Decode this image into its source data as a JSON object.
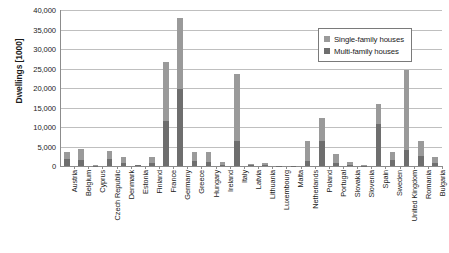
{
  "chart_data": {
    "type": "bar",
    "title": "",
    "subtitle": "",
    "xlabel": "",
    "ylabel": "Dwellings [1000]",
    "ylim": [
      0,
      40000
    ],
    "ytick_labels": [
      "0",
      "5,000",
      "10,000",
      "15,000",
      "20,000",
      "25,000",
      "30,000",
      "35,000",
      "40,000"
    ],
    "ytick_values": [
      0,
      5000,
      10000,
      15000,
      20000,
      25000,
      30000,
      35000,
      40000
    ],
    "grid": true,
    "stacked": true,
    "legend_position": "top-right",
    "categories": [
      "Austria",
      "Belgium",
      "Cyprus",
      "Czech Republic",
      "Denmark",
      "Estonia",
      "Finland",
      "France",
      "Germany",
      "Greece",
      "Hungary",
      "Ireland",
      "Italy",
      "Latvia",
      "Lithuania",
      "Luxembourg",
      "Malta",
      "Netherlands",
      "Poland",
      "Portugal",
      "Slovakia",
      "Slovenia",
      "Spain",
      "Sweden",
      "United Kingdom",
      "Romania",
      "Bulgaria"
    ],
    "series": [
      {
        "name": "Single-family houses",
        "color": "#9a9a9a",
        "values": [
          1900,
          2800,
          100,
          2200,
          1500,
          150,
          1600,
          15200,
          18100,
          2200,
          2600,
          800,
          17200,
          300,
          500,
          60,
          50,
          5100,
          6100,
          2400,
          700,
          120,
          5200,
          2000,
          20500,
          4000,
          1500
        ]
      },
      {
        "name": "Multi-family houses",
        "color": "#6e6e6e",
        "values": [
          1700,
          1600,
          80,
          1700,
          900,
          150,
          700,
          11500,
          19800,
          1300,
          1100,
          200,
          6500,
          200,
          250,
          60,
          50,
          1200,
          6300,
          800,
          300,
          90,
          10700,
          1500,
          4200,
          2500,
          900
        ]
      }
    ],
    "totals": [
      3600,
      4400,
      180,
      3900,
      2400,
      300,
      2300,
      26700,
      37900,
      3500,
      3700,
      1000,
      23700,
      500,
      750,
      120,
      100,
      6300,
      12400,
      3200,
      1000,
      210,
      15900,
      3500,
      24700,
      6500,
      2400
    ]
  },
  "legend": {
    "items": [
      {
        "label": "Single-family houses",
        "color": "#9a9a9a"
      },
      {
        "label": "Multi-family houses",
        "color": "#6e6e6e"
      }
    ]
  },
  "axis": {
    "y_title": "Dwellings [1000]"
  }
}
